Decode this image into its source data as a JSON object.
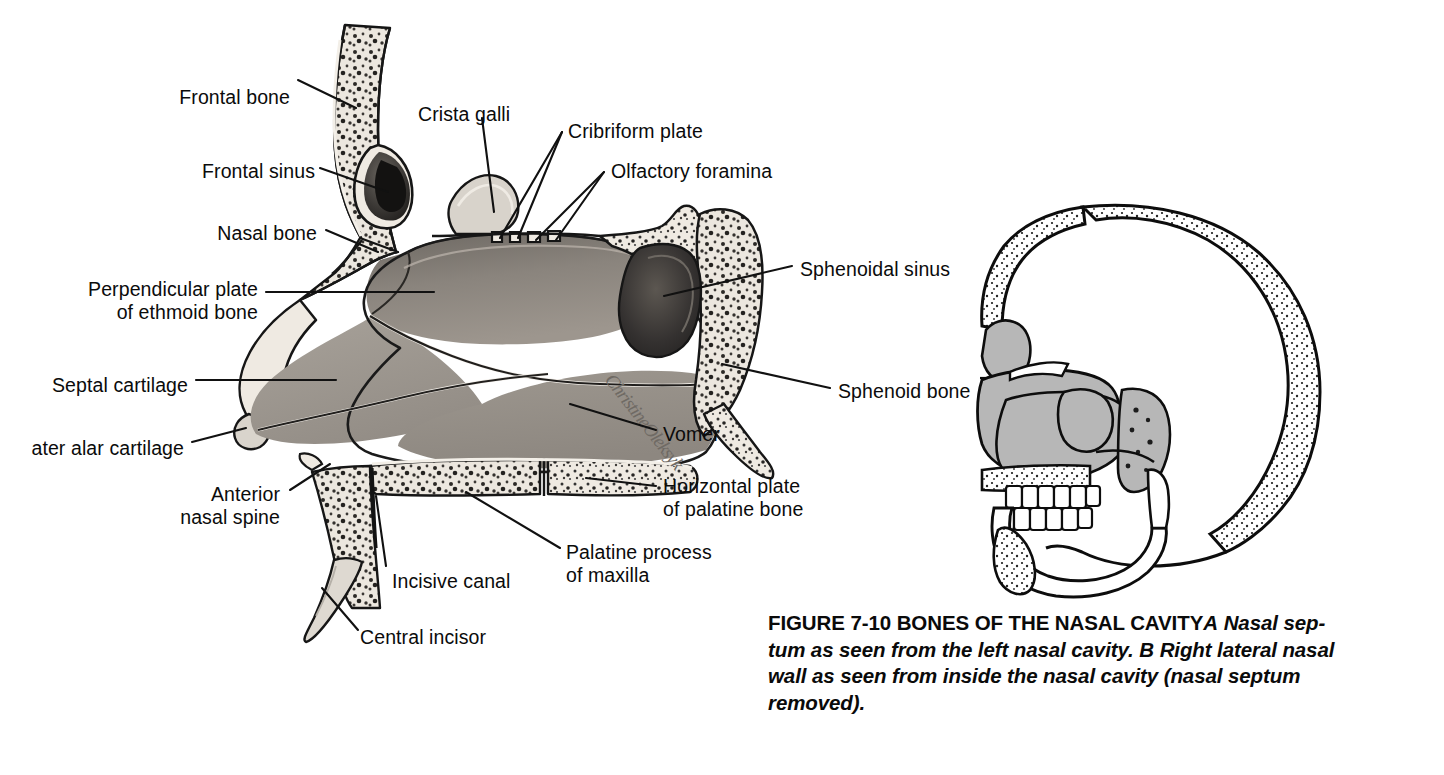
{
  "figure": {
    "caption_title": "FIGURE 7-10 BONES OF THE NASAL CAVITY",
    "caption_part_a": "A",
    "caption_text_a": " Nasal sep-\ntum as seen from the left nasal cavity. ",
    "caption_part_b": "B",
    "caption_text_b": " Right lateral nasal\nwall as seen from inside the nasal cavity (nasal septum\nremoved).",
    "artist_signature": "ChristineOleksyk"
  },
  "panel_a": {
    "name": "nasal-septum-sagittal-section",
    "labels": [
      {
        "id": "frontal-bone",
        "text": "Frontal bone",
        "x": 155,
        "y": 86,
        "align": "right",
        "w": 135
      },
      {
        "id": "frontal-sinus",
        "text": "Frontal sinus",
        "x": 175,
        "y": 160,
        "align": "right",
        "w": 140
      },
      {
        "id": "nasal-bone",
        "text": "Nasal bone",
        "x": 192,
        "y": 222,
        "align": "right",
        "w": 125
      },
      {
        "id": "perpendicular-plate",
        "text": "Perpendicular plate\nof ethmoid bone",
        "x": 58,
        "y": 278,
        "align": "right",
        "w": 200
      },
      {
        "id": "septal-cartilage",
        "text": "Septal cartilage",
        "x": 22,
        "y": 374,
        "align": "right",
        "w": 166
      },
      {
        "id": "greater-alar-cartilage",
        "text": "ater alar cartilage",
        "x": -6,
        "y": 437,
        "align": "right",
        "w": 190
      },
      {
        "id": "anterior-nasal-spine",
        "text": "Anterior\nnasal spine",
        "x": 155,
        "y": 483,
        "align": "right",
        "w": 125
      },
      {
        "id": "incisive-canal",
        "text": "Incisive canal",
        "x": 392,
        "y": 570,
        "align": "left",
        "w": 140
      },
      {
        "id": "central-incisor",
        "text": "Central incisor",
        "x": 360,
        "y": 626,
        "align": "left",
        "w": 150
      },
      {
        "id": "crista-galli",
        "text": "Crista galli",
        "x": 418,
        "y": 103,
        "align": "left",
        "w": 120
      },
      {
        "id": "cribriform-plate",
        "text": "Cribriform plate",
        "x": 568,
        "y": 120,
        "align": "left",
        "w": 160
      },
      {
        "id": "olfactory-foramina",
        "text": "Olfactory foramina",
        "x": 611,
        "y": 160,
        "align": "left",
        "w": 185
      },
      {
        "id": "sphenoidal-sinus",
        "text": "Sphenoidal sinus",
        "x": 800,
        "y": 258,
        "align": "left",
        "w": 170
      },
      {
        "id": "sphenoid-bone",
        "text": "Sphenoid bone",
        "x": 838,
        "y": 380,
        "align": "left",
        "w": 150
      },
      {
        "id": "vomer",
        "text": "Vomer",
        "x": 663,
        "y": 423,
        "align": "left",
        "w": 80
      },
      {
        "id": "horizontal-plate",
        "text": "Horizontal plate\nof palatine bone",
        "x": 663,
        "y": 475,
        "align": "left",
        "w": 175
      },
      {
        "id": "palatine-process",
        "text": "Palatine process\nof maxilla",
        "x": 566,
        "y": 541,
        "align": "left",
        "w": 175
      }
    ]
  },
  "panel_b": {
    "name": "lateral-skull-outline",
    "description": "Right lateral nasal wall, skull in profile with nasal region shaded"
  },
  "colors": {
    "ink": "#111111",
    "bone_light": "#eeeae2",
    "bone_mid": "#cfcac1",
    "septum_gray": "#9a948d",
    "septum_dark": "#6e6862",
    "sinus_dark": "#2b2b2b",
    "panel_b_gray": "#b7b7b7",
    "page_bg": "#ffffff"
  }
}
